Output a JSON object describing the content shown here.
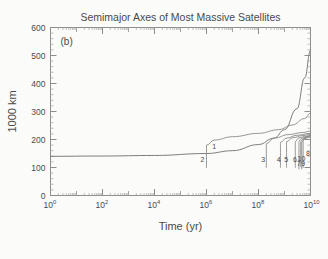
{
  "figure": {
    "title": "Semimajor Axes of Most Massive Satellites",
    "panel_label": "(b)",
    "background_color": "#fbfbfa",
    "line_color": "#8a8a8a",
    "axis_color": "#8e8e8e"
  },
  "chart_data": {
    "type": "line",
    "title": "Semimajor Axes of Most Massive Satellites",
    "panel": "(b)",
    "xlabel": "Time (yr)",
    "ylabel": "1000 km",
    "xscale": "log",
    "yscale": "linear",
    "xlim": [
      1,
      10000000000
    ],
    "ylim": [
      0,
      600
    ],
    "grid": false,
    "legend": "none (curves labeled inline 1-10)",
    "xticks": [
      {
        "value": 1,
        "label": "10",
        "exponent": "0"
      },
      {
        "value": 100,
        "label": "10",
        "exponent": "2"
      },
      {
        "value": 10000,
        "label": "10",
        "exponent": "4"
      },
      {
        "value": 1000000,
        "label": "10",
        "exponent": "6"
      },
      {
        "value": 100000000,
        "label": "10",
        "exponent": "8"
      },
      {
        "value": 10000000000,
        "label": "10",
        "exponent": "10"
      }
    ],
    "yticks": [
      0,
      100,
      200,
      300,
      400,
      500,
      600
    ],
    "series": [
      {
        "name": "1",
        "label": "1",
        "points": [
          [
            1,
            140
          ],
          [
            100,
            141
          ],
          [
            10000,
            143
          ],
          [
            1000000,
            150
          ],
          [
            10000000,
            160
          ],
          [
            100000000,
            182
          ],
          [
            400000000,
            205
          ],
          [
            1000000000,
            235
          ],
          [
            3000000000,
            310
          ],
          [
            6000000000,
            420
          ],
          [
            10000000000,
            520
          ]
        ]
      },
      {
        "name": "2",
        "label": "2",
        "points": [
          [
            1000000,
            100
          ],
          [
            1000000,
            180
          ],
          [
            2000000,
            198
          ],
          [
            10000000,
            210
          ],
          [
            100000000,
            222
          ],
          [
            600000000,
            235
          ],
          [
            2000000000,
            252
          ],
          [
            6000000000,
            275
          ],
          [
            10000000000,
            295
          ]
        ]
      },
      {
        "name": "3",
        "label": "3",
        "points": [
          [
            200000000,
            100
          ],
          [
            200000000,
            185
          ],
          [
            400000000,
            205
          ],
          [
            1500000000,
            218
          ],
          [
            5000000000,
            225
          ],
          [
            10000000000,
            230
          ]
        ]
      },
      {
        "name": "4",
        "label": "4",
        "points": [
          [
            700000000,
            100
          ],
          [
            700000000,
            190
          ],
          [
            1200000000,
            205
          ],
          [
            3000000000,
            215
          ],
          [
            10000000000,
            222
          ]
        ]
      },
      {
        "name": "5",
        "label": "5",
        "points": [
          [
            1200000000,
            100
          ],
          [
            1200000000,
            192
          ],
          [
            2000000000,
            206
          ],
          [
            5000000000,
            214
          ],
          [
            10000000000,
            219
          ]
        ]
      },
      {
        "name": "6",
        "label": "6",
        "points": [
          [
            2600000000,
            100
          ],
          [
            2600000000,
            193
          ],
          [
            3600000000,
            206
          ],
          [
            7000000000,
            212
          ],
          [
            10000000000,
            215
          ]
        ]
      },
      {
        "name": "7",
        "label": "7",
        "points": [
          [
            3600000000,
            95
          ],
          [
            3600000000,
            194
          ],
          [
            4600000000,
            205
          ],
          [
            8000000000,
            210
          ],
          [
            10000000000,
            212
          ]
        ]
      },
      {
        "name": "8",
        "label": "8",
        "points": [
          [
            5200000000,
            100
          ],
          [
            5200000000,
            196
          ],
          [
            6400000000,
            208
          ],
          [
            8600000000,
            213
          ],
          [
            10000000000,
            216
          ]
        ]
      },
      {
        "name": "9",
        "label": "9",
        "points": [
          [
            4600000000,
            95
          ],
          [
            4600000000,
            191
          ],
          [
            5600000000,
            202
          ],
          [
            8000000000,
            207
          ],
          [
            10000000000,
            209
          ]
        ]
      },
      {
        "name": "10",
        "label": "10",
        "points": [
          [
            4200000000,
            103
          ],
          [
            4200000000,
            192
          ],
          [
            5200000000,
            203
          ],
          [
            8000000000,
            208
          ],
          [
            10000000000,
            210
          ]
        ]
      }
    ],
    "curve_labels": [
      {
        "text": "1",
        "x": 2000000,
        "y": 165
      },
      {
        "text": "2",
        "x": 700000,
        "y": 118
      },
      {
        "text": "3",
        "x": 150000000,
        "y": 118
      },
      {
        "text": "4",
        "x": 600000000,
        "y": 118
      },
      {
        "text": "5",
        "x": 1150000000,
        "y": 118
      },
      {
        "text": "6",
        "x": 2500000000,
        "y": 118
      },
      {
        "text": "7",
        "x": 3500000000,
        "y": 104
      },
      {
        "text": "8",
        "x": 8000000000,
        "y": 142
      },
      {
        "text": "9",
        "x": 5200000000,
        "y": 104
      },
      {
        "text": "10",
        "x": 4500000000,
        "y": 122
      }
    ]
  }
}
